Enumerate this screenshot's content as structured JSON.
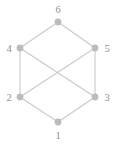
{
  "figure": {
    "width": 116,
    "height": 146,
    "background_color": "#ffffff",
    "node_color": "#bcbcbc",
    "edge_color": "#c9c9c9",
    "label_color": "#8f8f8f",
    "node_radius": 3.4
  },
  "graph_data": {
    "type": "graph",
    "layout": "hexagon",
    "node_count": 6,
    "edge_count": 8,
    "nodes": [
      {
        "id": "1",
        "label": "1",
        "x": 58,
        "y": 122,
        "label_x": 58,
        "label_y": 139,
        "label_anchor": "middle"
      },
      {
        "id": "2",
        "label": "2",
        "x": 20,
        "y": 97,
        "label_x": 9,
        "label_y": 101,
        "label_anchor": "middle"
      },
      {
        "id": "3",
        "label": "3",
        "x": 95,
        "y": 97,
        "label_x": 107,
        "label_y": 101,
        "label_anchor": "middle"
      },
      {
        "id": "4",
        "label": "4",
        "x": 20,
        "y": 48,
        "label_x": 9,
        "label_y": 52,
        "label_anchor": "middle"
      },
      {
        "id": "5",
        "label": "5",
        "x": 95,
        "y": 48,
        "label_x": 107,
        "label_y": 52,
        "label_anchor": "middle"
      },
      {
        "id": "6",
        "label": "6",
        "x": 58,
        "y": 22,
        "label_x": 58,
        "label_y": 13,
        "label_anchor": "middle"
      }
    ],
    "edges": [
      {
        "source": "6",
        "target": "4"
      },
      {
        "source": "6",
        "target": "5"
      },
      {
        "source": "4",
        "target": "2"
      },
      {
        "source": "5",
        "target": "3"
      },
      {
        "source": "2",
        "target": "1"
      },
      {
        "source": "3",
        "target": "1"
      },
      {
        "source": "4",
        "target": "3"
      },
      {
        "source": "2",
        "target": "5"
      }
    ]
  }
}
